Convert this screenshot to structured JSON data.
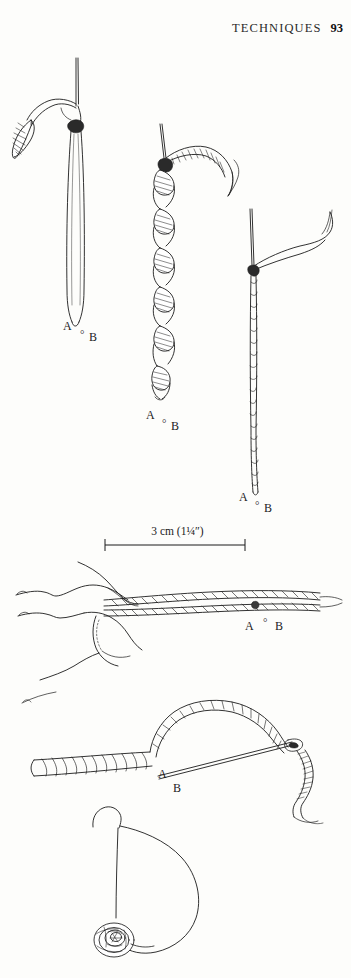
{
  "page": {
    "running_head": "TECHNIQUES",
    "folio": "93",
    "background_color": "#fdfdfb",
    "ink_color": "#1b1b1b",
    "width": 351,
    "height": 978
  },
  "scale_bar": {
    "label": "3 cm (1¼″)",
    "x_start": 105,
    "x_end": 245,
    "y": 545
  },
  "figures": [
    {
      "id": "fig-1",
      "name": "loop-on-hook",
      "caption_labels": {
        "a": "A",
        "dot": "°",
        "b": "B"
      },
      "label_a_pos": {
        "x": 63,
        "y": 327
      },
      "label_dot_pos": {
        "x": 81,
        "y": 337
      },
      "label_b_pos": {
        "x": 89,
        "y": 340
      }
    },
    {
      "id": "fig-2",
      "name": "twisted-strand",
      "caption_labels": {
        "a": "A",
        "dot": "°",
        "b": "B"
      },
      "label_a_pos": {
        "x": 146,
        "y": 416
      },
      "label_dot_pos": {
        "x": 163,
        "y": 426
      },
      "label_b_pos": {
        "x": 171,
        "y": 429
      }
    },
    {
      "id": "fig-3",
      "name": "tight-twisted-cord",
      "caption_labels": {
        "a": "A",
        "dot": "°",
        "b": "B"
      },
      "label_a_pos": {
        "x": 239,
        "y": 498
      },
      "label_dot_pos": {
        "x": 256,
        "y": 508
      },
      "label_b_pos": {
        "x": 264,
        "y": 511
      }
    },
    {
      "id": "fig-4",
      "name": "hand-rolling-cords",
      "caption_labels": {
        "a": "A",
        "dot": "°",
        "b": "B"
      },
      "label_a_pos": {
        "x": 245,
        "y": 627
      },
      "label_dot_pos": {
        "x": 263,
        "y": 623
      },
      "label_b_pos": {
        "x": 274,
        "y": 628
      }
    },
    {
      "id": "fig-5",
      "name": "cord-loop-with-needle",
      "caption_labels": {
        "a": "A",
        "b": "B"
      },
      "label_a_pos": {
        "x": 160,
        "y": 775
      },
      "label_b_pos": {
        "x": 174,
        "y": 789
      }
    },
    {
      "id": "fig-6",
      "name": "knotted-cord-loop",
      "caption_labels": {}
    }
  ]
}
